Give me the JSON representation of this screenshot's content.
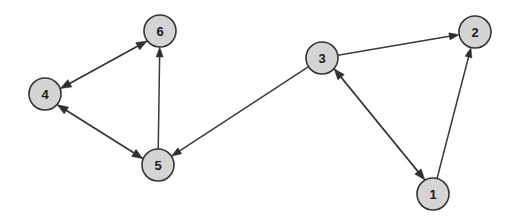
{
  "figure": {
    "name": "directed-graph-diagram",
    "width": 519,
    "height": 221,
    "background_color": "#ffffff",
    "node_fill_color": "#d4d4d4",
    "node_stroke_color": "#333333",
    "node_radius": 16,
    "edge_color": "#3a3a3a",
    "label_color": "#1a1a1a"
  },
  "nodes": [
    {
      "id": "1",
      "label": "1",
      "cx": 433,
      "cy": 194
    },
    {
      "id": "2",
      "label": "2",
      "cx": 475,
      "cy": 32
    },
    {
      "id": "3",
      "label": "3",
      "cx": 322,
      "cy": 58
    },
    {
      "id": "4",
      "label": "4",
      "cx": 45,
      "cy": 94
    },
    {
      "id": "5",
      "label": "5",
      "cx": 158,
      "cy": 165
    },
    {
      "id": "6",
      "label": "6",
      "cx": 160,
      "cy": 31
    }
  ],
  "edges": [
    {
      "from": "4",
      "to": "6",
      "directed": true,
      "style": "parallel-pair"
    },
    {
      "from": "6",
      "to": "4",
      "directed": true,
      "style": "parallel-pair"
    },
    {
      "from": "4",
      "to": "5",
      "directed": true,
      "style": "parallel-pair"
    },
    {
      "from": "5",
      "to": "4",
      "directed": true,
      "style": "parallel-pair"
    },
    {
      "from": "5",
      "to": "6",
      "directed": true,
      "style": "single"
    },
    {
      "from": "3",
      "to": "5",
      "directed": true,
      "style": "single"
    },
    {
      "from": "3",
      "to": "2",
      "directed": true,
      "style": "single"
    },
    {
      "from": "1",
      "to": "3",
      "directed": true,
      "style": "parallel-pair"
    },
    {
      "from": "3",
      "to": "1",
      "directed": true,
      "style": "parallel-pair"
    },
    {
      "from": "1",
      "to": "2",
      "directed": true,
      "style": "single"
    }
  ]
}
